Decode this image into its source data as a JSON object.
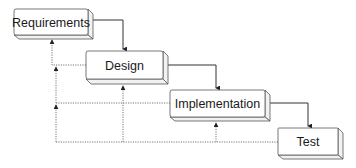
{
  "diagram": {
    "type": "waterfall",
    "colors": {
      "box_fill": "#ffffff",
      "box_side": "#f2f2f2",
      "stroke": "#555555",
      "text": "#1a1a1a"
    },
    "stages": [
      {
        "id": "requirements",
        "label": "Requirements"
      },
      {
        "id": "design",
        "label": "Design"
      },
      {
        "id": "implementation",
        "label": "Implementation"
      },
      {
        "id": "test",
        "label": "Test"
      }
    ],
    "forward_flows": [
      {
        "from": "requirements",
        "to": "design",
        "style": "solid"
      },
      {
        "from": "design",
        "to": "implementation",
        "style": "solid"
      },
      {
        "from": "implementation",
        "to": "test",
        "style": "solid"
      }
    ],
    "feedback_flows": [
      {
        "from": "design",
        "to": "requirements",
        "style": "dotted"
      },
      {
        "from": "implementation",
        "to": "requirements",
        "style": "dotted"
      },
      {
        "from": "implementation",
        "to": "design",
        "style": "dotted"
      },
      {
        "from": "test",
        "to": "requirements",
        "style": "dotted"
      },
      {
        "from": "test",
        "to": "design",
        "style": "dotted"
      },
      {
        "from": "test",
        "to": "implementation",
        "style": "dotted"
      }
    ]
  }
}
